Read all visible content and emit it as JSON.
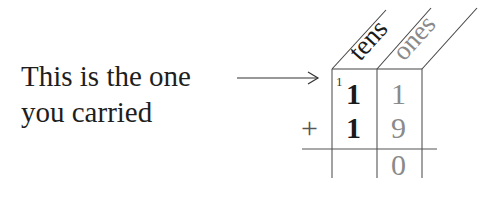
{
  "caption": {
    "line1": "This is the one",
    "line2": "you carried"
  },
  "columns": {
    "tens_label": "tens",
    "ones_label": "ones"
  },
  "addition": {
    "carry": "1",
    "row1": {
      "tens": "1",
      "ones": "1"
    },
    "operator": "+",
    "row2": {
      "tens": "1",
      "ones": "9"
    },
    "result": {
      "tens": "",
      "ones": "0"
    }
  },
  "colors": {
    "tens_text": "#1a1a1a",
    "ones_text": "#8a8a8a",
    "grid_line": "#555555"
  }
}
